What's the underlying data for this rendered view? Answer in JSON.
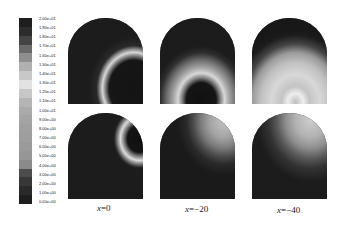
{
  "chart_data": {
    "type": "heatmap",
    "title": "",
    "layout": {
      "rows": 2,
      "cols": 3,
      "shape": "arch (semicircular top, rectangular bottom)"
    },
    "colorbar": {
      "orientation": "vertical",
      "position": "left",
      "range": [
        0,
        20
      ],
      "tick_labels": [
        "2.00e+01",
        "1.90e+01",
        "1.80e+01",
        "1.70e+01",
        "1.60e+01",
        "1.50e+01",
        "1.40e+01",
        "1.30e+01",
        "1.20e+01",
        "1.10e+01",
        "1.00e+01",
        "9.00e+00",
        "8.00e+00",
        "7.00e+00",
        "6.00e+00",
        "5.00e+00",
        "4.00e+00",
        "3.00e+00",
        "2.00e+00",
        "1.00e+00",
        "0.00e+00"
      ],
      "segment_colors": [
        "#1e1e1e",
        "#2c2c2c",
        "#444444",
        "#6a6a6a",
        "#8e8e8e",
        "#b0b0b0",
        "#c8c8c8",
        "#e2e2e2",
        "#c6c6c6",
        "#b4b4b4",
        "#aaaaaa",
        "#a4a4a4",
        "#a0a0a0",
        "#9e9e9e",
        "#9a9a9a",
        "#969696",
        "#8a8a8a",
        "#4c4c4c",
        "#383838",
        "#2a2a2a",
        "#1e1e1e"
      ]
    },
    "columns": [
      {
        "label": "x=0",
        "var": "x",
        "value": "0"
      },
      {
        "label": "x=−20",
        "var": "x",
        "value": "−20"
      },
      {
        "label": "x=−40",
        "var": "x",
        "value": "−40"
      }
    ],
    "panels": [
      {
        "row": 1,
        "col": 1,
        "description": "dark field with thin bright ring arc at lower right, dark core at lower-right corner"
      },
      {
        "row": 1,
        "col": 2,
        "description": "dark upper field, broad bright ring centered lower-middle-right, dark core at bottom"
      },
      {
        "row": 1,
        "col": 3,
        "description": "mostly light gray field, brightest spot at bottom center, dark only at upper-left edge"
      },
      {
        "row": 2,
        "col": 1,
        "description": "dark field with small bright ring at upper right, dark core at right edge"
      },
      {
        "row": 2,
        "col": 2,
        "description": "dark field with graded lighter region in upper right quadrant"
      },
      {
        "row": 2,
        "col": 3,
        "description": "dark field with graded lighter region in upper right, light gray near top"
      }
    ],
    "xlabel": "",
    "ylabel": "",
    "grid": false,
    "legend": "colorbar-left"
  },
  "labels": {
    "col1": {
      "var": "x",
      "eq": "=0"
    },
    "col2": {
      "var": "x",
      "eq": "=−20"
    },
    "col3": {
      "var": "x",
      "eq": "=−40"
    }
  }
}
